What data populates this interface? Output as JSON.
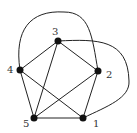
{
  "diagram": {
    "type": "graph",
    "colors": {
      "edge": "#222222",
      "node": "#111111",
      "label": "#333333",
      "background": "#ffffff"
    },
    "nodes": [
      {
        "id": "1",
        "label": "1",
        "x": 83,
        "y": 118,
        "lx": 93,
        "ly": 127
      },
      {
        "id": "2",
        "label": "2",
        "x": 98,
        "y": 71,
        "lx": 106,
        "ly": 78
      },
      {
        "id": "3",
        "label": "3",
        "x": 58,
        "y": 41,
        "lx": 52,
        "ly": 35
      },
      {
        "id": "4",
        "label": "4",
        "x": 20,
        "y": 70,
        "lx": 7,
        "ly": 73
      },
      {
        "id": "5",
        "label": "5",
        "x": 34,
        "y": 118,
        "lx": 23,
        "ly": 127
      }
    ],
    "edges": [
      {
        "from": "1",
        "to": "5",
        "shape": "straight"
      },
      {
        "from": "1",
        "to": "2",
        "shape": "straight"
      },
      {
        "from": "1",
        "to": "4",
        "shape": "straight"
      },
      {
        "from": "2",
        "to": "3",
        "shape": "straight"
      },
      {
        "from": "2",
        "to": "5",
        "shape": "straight"
      },
      {
        "from": "3",
        "to": "4",
        "shape": "straight"
      },
      {
        "from": "3",
        "to": "5",
        "shape": "straight"
      },
      {
        "from": "4",
        "to": "5",
        "shape": "straight"
      },
      {
        "from": "4",
        "to": "2",
        "shape": "curve-top"
      },
      {
        "from": "3",
        "to": "1",
        "shape": "curve-right"
      }
    ]
  }
}
